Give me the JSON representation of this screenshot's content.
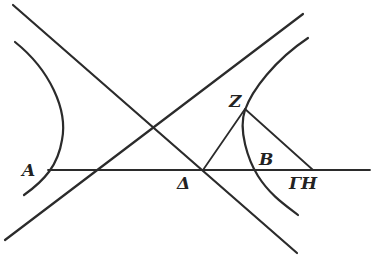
{
  "figure": {
    "labels": {
      "A": "A",
      "Z": "Z",
      "B": "B",
      "Delta": "Δ",
      "GammaH": "ΓH"
    },
    "colors": {
      "ink": "#2b2b2b",
      "background": "#ffffff"
    },
    "elements": [
      "asymptote-descending",
      "asymptote-ascending",
      "left-hyperbola-branch",
      "right-hyperbola-branch",
      "axis-line",
      "line-delta-z",
      "line-z-h"
    ]
  }
}
